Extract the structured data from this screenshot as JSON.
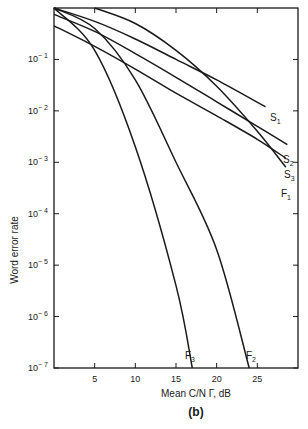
{
  "chart_data": {
    "type": "line",
    "title": "",
    "panel_label": "(b)",
    "xlabel": "Mean C/N Γ, dB",
    "ylabel": "Word error rate",
    "xlim": [
      0,
      30
    ],
    "ylim": [
      1e-07,
      1
    ],
    "yscale": "log",
    "grid": false,
    "x_ticks": [
      5,
      10,
      15,
      20,
      25
    ],
    "x_tick_labels": [
      "5",
      "10",
      "15",
      "20",
      "25"
    ],
    "y_ticks": [
      0.1,
      0.01,
      0.001,
      0.0001,
      1e-05,
      1e-06,
      1e-07
    ],
    "y_tick_labels": [
      {
        "base": "10",
        "exp": "− 1"
      },
      {
        "base": "10",
        "exp": "− 2"
      },
      {
        "base": "10",
        "exp": "− 3"
      },
      {
        "base": "10",
        "exp": "− 4"
      },
      {
        "base": "10",
        "exp": "− 5"
      },
      {
        "base": "10",
        "exp": "− 6"
      },
      {
        "base": "10",
        "exp": "− 7"
      }
    ],
    "series": [
      {
        "name": "S1",
        "label": "S",
        "sub": "1",
        "x": [
          0,
          5,
          10,
          15,
          20,
          26
        ],
        "y": [
          1.0,
          0.55,
          0.25,
          0.1,
          0.04,
          0.012
        ]
      },
      {
        "name": "S2",
        "label": "S",
        "sub": "2",
        "x": [
          0,
          5,
          10,
          15,
          20,
          25,
          28.7
        ],
        "y": [
          0.75,
          0.35,
          0.13,
          0.045,
          0.015,
          0.005,
          0.0022
        ]
      },
      {
        "name": "S3",
        "label": "S",
        "sub": "3",
        "x": [
          0,
          5,
          10,
          15,
          20,
          25,
          28.5
        ],
        "y": [
          0.45,
          0.18,
          0.065,
          0.022,
          0.008,
          0.0028,
          0.0012
        ]
      },
      {
        "name": "F1",
        "label": "F",
        "sub": "1",
        "x": [
          5,
          10,
          15,
          20,
          25,
          28.5
        ],
        "y": [
          1.0,
          0.5,
          0.15,
          0.03,
          0.004,
          0.0008
        ]
      },
      {
        "name": "F2",
        "label": "F",
        "sub": "2",
        "x": [
          0,
          5,
          10,
          15,
          20,
          24
        ],
        "y": [
          1.0,
          0.4,
          0.04,
          0.001,
          2e-05,
          1e-07
        ]
      },
      {
        "name": "F3",
        "label": "F",
        "sub": "3",
        "x": [
          0,
          5,
          10,
          15,
          17
        ],
        "y": [
          1.0,
          0.15,
          0.002,
          4e-06,
          1e-07
        ]
      }
    ]
  }
}
